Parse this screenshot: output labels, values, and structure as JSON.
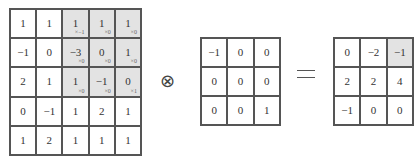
{
  "operators": {
    "convolution_symbol": "⊗",
    "equals": "="
  },
  "input_matrix": {
    "rows": [
      [
        {
          "v": "1"
        },
        {
          "v": "1"
        },
        {
          "v": "1",
          "s": "×−1",
          "hl": true
        },
        {
          "v": "1",
          "s": "×0",
          "hl": true
        },
        {
          "v": "1",
          "s": "×0",
          "hl": true
        }
      ],
      [
        {
          "v": "−1"
        },
        {
          "v": "0"
        },
        {
          "v": "−3",
          "s": "×0",
          "hl": true
        },
        {
          "v": "0",
          "s": "×0",
          "hl": true
        },
        {
          "v": "1",
          "s": "×0",
          "hl": true
        }
      ],
      [
        {
          "v": "2"
        },
        {
          "v": "1"
        },
        {
          "v": "1",
          "s": "×0",
          "hl": true
        },
        {
          "v": "−1",
          "s": "×0",
          "hl": true
        },
        {
          "v": "0",
          "s": "×1",
          "hl": true
        }
      ],
      [
        {
          "v": "0"
        },
        {
          "v": "−1"
        },
        {
          "v": "1"
        },
        {
          "v": "2"
        },
        {
          "v": "1"
        }
      ],
      [
        {
          "v": "1"
        },
        {
          "v": "2"
        },
        {
          "v": "1"
        },
        {
          "v": "1"
        },
        {
          "v": "1"
        }
      ]
    ]
  },
  "kernel_matrix": {
    "rows": [
      [
        {
          "v": "−1"
        },
        {
          "v": "0"
        },
        {
          "v": "0"
        }
      ],
      [
        {
          "v": "0"
        },
        {
          "v": "0"
        },
        {
          "v": "0"
        }
      ],
      [
        {
          "v": "0"
        },
        {
          "v": "0"
        },
        {
          "v": "1"
        }
      ]
    ]
  },
  "output_matrix": {
    "rows": [
      [
        {
          "v": "0"
        },
        {
          "v": "−2"
        },
        {
          "v": "−1",
          "hl": true
        }
      ],
      [
        {
          "v": "2"
        },
        {
          "v": "2"
        },
        {
          "v": "4"
        }
      ],
      [
        {
          "v": "−1"
        },
        {
          "v": "0"
        },
        {
          "v": "0"
        }
      ]
    ]
  },
  "colors": {
    "highlight": "#e3e3e3",
    "border": "#555555"
  }
}
